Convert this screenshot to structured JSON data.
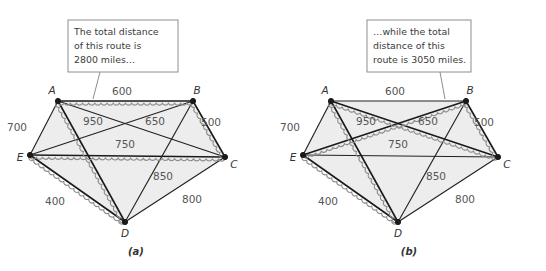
{
  "figure": {
    "type": "graph-diagram",
    "background_color": "#ffffff",
    "fill_color": "#ededed",
    "edge_color": "#222222",
    "highlight_color": "#8c8c8c"
  },
  "panels": [
    {
      "id": "a",
      "subcaption": "(a)",
      "callout": {
        "lines": [
          "The total distance",
          "of this route is",
          "2800 miles…"
        ],
        "border_color": "#8e8e8e"
      },
      "nodes": [
        {
          "id": "A",
          "label": "A",
          "x": 58,
          "y": 101
        },
        {
          "id": "B",
          "label": "B",
          "x": 193,
          "y": 101
        },
        {
          "id": "C",
          "label": "C",
          "x": 225,
          "y": 157
        },
        {
          "id": "D",
          "label": "D",
          "x": 125,
          "y": 222
        },
        {
          "id": "E",
          "label": "E",
          "x": 30,
          "y": 155
        }
      ],
      "edges": [
        {
          "from": "A",
          "to": "B",
          "weight": "600",
          "label_x": 122,
          "label_y": 95,
          "highlighted": true
        },
        {
          "from": "B",
          "to": "C",
          "weight": "500",
          "label_x": 211,
          "label_y": 126,
          "highlighted": true
        },
        {
          "from": "E",
          "to": "C",
          "weight": "750",
          "label_x": 125,
          "label_y": 148,
          "highlighted": true
        },
        {
          "from": "E",
          "to": "D",
          "weight": "400",
          "label_x": 55,
          "label_y": 205,
          "highlighted": true
        },
        {
          "from": "A",
          "to": "D",
          "weight": "950",
          "label_x": 93,
          "label_y": 125,
          "highlighted": true
        },
        {
          "from": "A",
          "to": "E",
          "weight": "700",
          "label_x": 17,
          "label_y": 131,
          "highlighted": false
        },
        {
          "from": "A",
          "to": "C",
          "weight": "",
          "label_x": 0,
          "label_y": 0,
          "highlighted": false
        },
        {
          "from": "E",
          "to": "B",
          "weight": "650",
          "label_x": 155,
          "label_y": 125,
          "highlighted": false
        },
        {
          "from": "B",
          "to": "D",
          "weight": "850",
          "label_x": 163,
          "label_y": 180,
          "highlighted": false
        },
        {
          "from": "C",
          "to": "D",
          "weight": "800",
          "label_x": 192,
          "label_y": 203,
          "highlighted": false
        }
      ],
      "route": [
        "A",
        "B",
        "C",
        "E",
        "D",
        "A"
      ],
      "total_distance": "2800 miles"
    },
    {
      "id": "b",
      "subcaption": "(b)",
      "callout": {
        "lines": [
          "…while the total",
          "distance  of this",
          "route is 3050 miles."
        ],
        "border_color": "#8e8e8e"
      },
      "nodes": [
        {
          "id": "A",
          "label": "A",
          "x": 58,
          "y": 101
        },
        {
          "id": "B",
          "label": "B",
          "x": 193,
          "y": 101
        },
        {
          "id": "C",
          "label": "C",
          "x": 225,
          "y": 157
        },
        {
          "id": "D",
          "label": "D",
          "x": 125,
          "y": 222
        },
        {
          "id": "E",
          "label": "E",
          "x": 30,
          "y": 155
        }
      ],
      "edges": [
        {
          "from": "A",
          "to": "B",
          "weight": "600",
          "label_x": 122,
          "label_y": 95,
          "highlighted": false
        },
        {
          "from": "B",
          "to": "C",
          "weight": "500",
          "label_x": 211,
          "label_y": 126,
          "highlighted": true
        },
        {
          "from": "E",
          "to": "C",
          "weight": "750",
          "label_x": 125,
          "label_y": 148,
          "highlighted": false
        },
        {
          "from": "E",
          "to": "D",
          "weight": "400",
          "label_x": 55,
          "label_y": 205,
          "highlighted": true
        },
        {
          "from": "A",
          "to": "D",
          "weight": "950",
          "label_x": 93,
          "label_y": 125,
          "highlighted": true
        },
        {
          "from": "A",
          "to": "E",
          "weight": "700",
          "label_x": 17,
          "label_y": 131,
          "highlighted": false
        },
        {
          "from": "A",
          "to": "C",
          "weight": "",
          "label_x": 0,
          "label_y": 0,
          "highlighted": true
        },
        {
          "from": "E",
          "to": "B",
          "weight": "650",
          "label_x": 155,
          "label_y": 125,
          "highlighted": true
        },
        {
          "from": "B",
          "to": "D",
          "weight": "850",
          "label_x": 163,
          "label_y": 180,
          "highlighted": false
        },
        {
          "from": "C",
          "to": "D",
          "weight": "800",
          "label_x": 192,
          "label_y": 203,
          "highlighted": false
        }
      ],
      "route": [
        "A",
        "C",
        "B",
        "E",
        "D",
        "A"
      ],
      "total_distance": "3050 miles"
    }
  ]
}
